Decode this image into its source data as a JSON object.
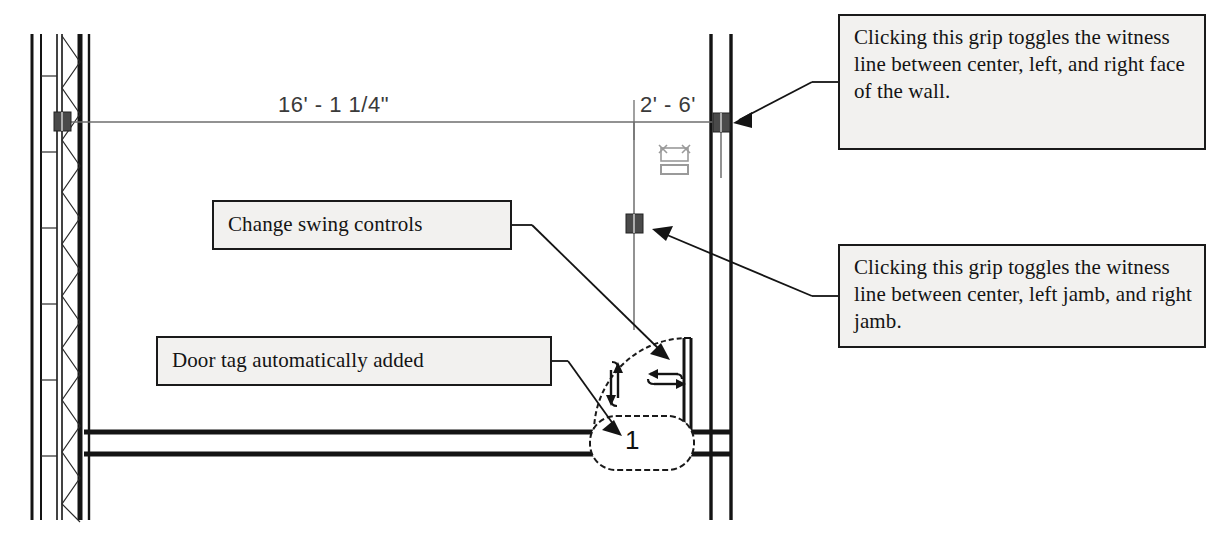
{
  "drawing": {
    "type": "architectural-floor-plan",
    "title": "Door placement in wall with dimension witness line grips",
    "dimensions": [
      {
        "id": "wall-run",
        "label": "16' - 1 1/4\""
      },
      {
        "id": "door-offset",
        "label": "2' - 6'"
      }
    ],
    "door": {
      "tag_number": "1",
      "swing_controls": {
        "flip_vertical_icon": "vertical-double-arrow-icon",
        "flip_horizontal_icon": "horizontal-double-arrow-icon"
      }
    },
    "grips": [
      {
        "id": "wall-grip",
        "name": "witness-line-grip-wall"
      },
      {
        "id": "jamb-grip",
        "name": "witness-line-grip-jamb"
      },
      {
        "id": "left-wall-grip",
        "name": "witness-line-grip-left-wall"
      }
    ],
    "widget": {
      "name": "move-constraint-widget-icon"
    }
  },
  "callouts": {
    "wall_face": "Clicking this grip toggles the witness line between center, left, and right face of the wall.",
    "jamb": "Clicking this grip toggles the witness line between center, left jamb, and right jamb.",
    "swing": "Change swing controls",
    "door_tag": "Door tag automatically added"
  },
  "colors": {
    "ink": "#141414",
    "callout_fill": "#f2f1ef",
    "dim_text": "#3a3a3a",
    "grip": "#4a4a4a",
    "witness_line": "#6e6e6e"
  }
}
